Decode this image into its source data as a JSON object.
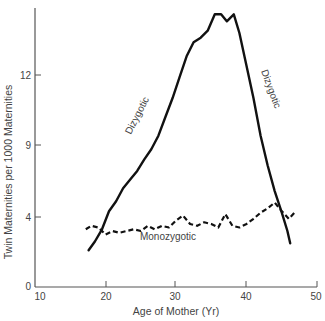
{
  "chart_data": {
    "type": "line",
    "title": "",
    "xlabel": "Age of Mother (Yr)",
    "ylabel": "Twin Maternities per 1000 Maternities",
    "xlim": [
      10,
      50
    ],
    "ylim": [
      0,
      15
    ],
    "x_ticks": [
      10,
      20,
      30,
      40,
      50
    ],
    "y_ticks": [
      0,
      4,
      9,
      12
    ],
    "grid": false,
    "legend": "none (inline curve labels)",
    "series": [
      {
        "name": "Dizygotic",
        "style": "solid",
        "x": [
          17.6,
          18.5,
          19.5,
          20.5,
          21.5,
          22.5,
          23.5,
          24.5,
          25.5,
          26.5,
          27.5,
          28.5,
          29.5,
          30.5,
          31.5,
          32.5,
          33.5,
          34.5,
          35.5,
          36.4,
          37.2,
          38.2,
          39.0,
          40.0,
          41.0,
          42.0,
          43.0,
          44.0,
          45.0,
          45.8,
          46.2
        ],
        "values": [
          2.1,
          2.6,
          3.3,
          4.4,
          5.1,
          6.0,
          6.6,
          7.2,
          8.0,
          8.7,
          9.4,
          10.2,
          11.0,
          11.9,
          12.8,
          13.4,
          13.6,
          13.9,
          14.6,
          14.6,
          14.3,
          14.6,
          13.8,
          12.4,
          11.0,
          9.4,
          7.6,
          5.8,
          4.3,
          3.2,
          2.5
        ]
      },
      {
        "name": "Monozygotic",
        "style": "dashed",
        "x": [
          17.2,
          18.0,
          19.0,
          20.0,
          21.0,
          22.0,
          23.0,
          24.0,
          25.0,
          26.0,
          27.0,
          28.0,
          29.0,
          30.0,
          31.0,
          32.0,
          33.0,
          34.0,
          35.0,
          36.0,
          37.0,
          38.0,
          39.0,
          40.0,
          41.0,
          42.0,
          43.0,
          44.0,
          45.0,
          46.0,
          47.0
        ],
        "values": [
          3.3,
          3.5,
          3.4,
          3.0,
          3.2,
          3.1,
          3.2,
          3.3,
          3.2,
          3.5,
          3.3,
          3.5,
          3.4,
          3.8,
          4.1,
          3.6,
          3.5,
          3.7,
          3.6,
          3.4,
          4.2,
          3.5,
          3.4,
          3.6,
          3.9,
          4.3,
          4.6,
          5.0,
          4.4,
          3.9,
          4.4
        ]
      }
    ],
    "annotations": [
      {
        "text": "Dizygotic",
        "position": "along rising dizygotic curve, ages ~24-28"
      },
      {
        "text": "Dizygotic",
        "position": "along falling dizygotic curve, ages ~40-43"
      },
      {
        "text": "Monozygotic",
        "position": "below monozygotic curve, ages ~25-32"
      }
    ]
  },
  "labels": {
    "xlabel": "Age of Mother (Yr)",
    "ylabel": "Twin Maternities per 1000 Maternities",
    "dizygotic_left": "Dizygotic",
    "dizygotic_right": "Dizygotic",
    "monozygotic": "Monozygotic",
    "xticks": [
      "10",
      "20",
      "30",
      "40",
      "50"
    ],
    "yticks": [
      "0",
      "4",
      "9",
      "12"
    ]
  },
  "colors": {
    "axis": "#555555",
    "curve": "#111111",
    "text": "#444444"
  }
}
